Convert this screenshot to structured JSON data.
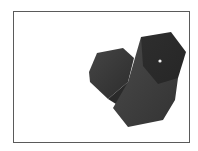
{
  "image": {
    "description": "3D rendering of two dark grey hexagonal prisms inside a thin rectangular frame",
    "background": "#ffffff",
    "frame_color": "#5a5a5a",
    "colors": {
      "small_prism_face": "#3a3a3a",
      "small_prism_side": "#2e2e2e",
      "large_prism_face": "#343434",
      "large_prism_side": "#3f3f3f",
      "highlight": "#f2f2f2"
    }
  }
}
